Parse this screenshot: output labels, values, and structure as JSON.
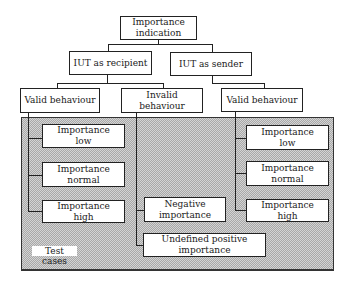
{
  "diagram": {
    "root": {
      "label_line1": "Importance",
      "label_line2": "indication"
    },
    "level1": [
      {
        "label": "IUT as recipient"
      },
      {
        "label": "IUT as sender"
      }
    ],
    "level2": [
      {
        "label": "Valid behaviour"
      },
      {
        "label": "Invalid behaviour"
      },
      {
        "label": "Valid behaviour"
      }
    ],
    "test_cases_label": "Test cases",
    "recipient_valid_cases": [
      {
        "line1": "Importance",
        "line2": "low"
      },
      {
        "line1": "Importance",
        "line2": "normal"
      },
      {
        "line1": "Importance",
        "line2": "high"
      }
    ],
    "recipient_invalid_cases": [
      {
        "line1": "Negative",
        "line2": "importance"
      },
      {
        "line1": "Undefined positive",
        "line2": "importance"
      }
    ],
    "sender_valid_cases": [
      {
        "line1": "Importance",
        "line2": "low"
      },
      {
        "line1": "Importance",
        "line2": "normal"
      },
      {
        "line1": "Importance",
        "line2": "high"
      }
    ]
  },
  "colors": {
    "border": "#222222",
    "shade": "#c8c8c8",
    "box_fill": "#ffffff"
  }
}
